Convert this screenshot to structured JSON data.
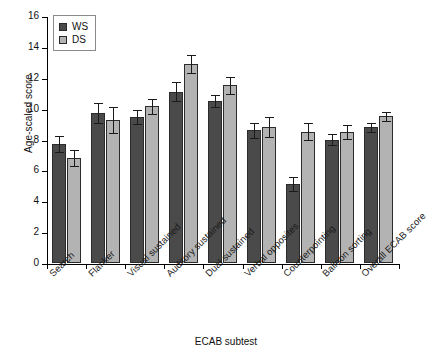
{
  "chart_data": {
    "type": "bar",
    "title": "",
    "xlabel": "ECAB subtest",
    "ylabel": "Age-scaled score",
    "ylim": [
      0,
      16
    ],
    "ytick_labels": [
      "0",
      "2",
      "4",
      "6",
      "8",
      "10",
      "12",
      "14",
      "16"
    ],
    "yticks": [
      0,
      2,
      4,
      6,
      8,
      10,
      12,
      14,
      16
    ],
    "grid": false,
    "legend_position": "upper-left",
    "categories": [
      "Search",
      "Flanker",
      "Visual sustained",
      "Auditory sustained",
      "Dual sustained",
      "Verbal opposites",
      "Counterpointing",
      "Balloon sorting",
      "Overall ECAB score"
    ],
    "series": [
      {
        "name": "WS",
        "color": "#4a4a4a",
        "values": [
          7.7,
          9.7,
          9.45,
          11.1,
          10.5,
          8.6,
          5.1,
          8.0,
          8.8
        ],
        "errors": [
          0.5,
          0.65,
          0.45,
          0.6,
          0.4,
          0.5,
          0.45,
          0.35,
          0.3
        ]
      },
      {
        "name": "DS",
        "color": "#b3b3b3",
        "values": [
          6.8,
          9.25,
          10.15,
          12.9,
          11.5,
          8.8,
          8.5,
          8.5,
          9.5
        ],
        "errors": [
          0.5,
          0.85,
          0.5,
          0.6,
          0.55,
          0.65,
          0.55,
          0.45,
          0.3
        ]
      }
    ]
  },
  "legend": {
    "items": [
      {
        "label": "WS"
      },
      {
        "label": "DS"
      }
    ]
  }
}
